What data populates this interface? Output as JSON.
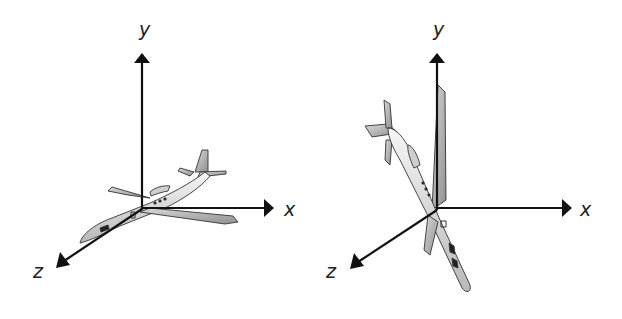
{
  "diagrams": [
    {
      "id": "level-flight",
      "axes": {
        "x_label": "x",
        "y_label": "y",
        "z_label": "z"
      },
      "object": "airplane",
      "orientation": "banked, nose toward +z, roughly level"
    },
    {
      "id": "nose-down",
      "axes": {
        "x_label": "x",
        "y_label": "y",
        "z_label": "z"
      },
      "object": "airplane",
      "orientation": "pitched nose-down, fuselage nearly vertical"
    }
  ],
  "colors": {
    "axis": "#111111",
    "plane_fill": "#e6e6e6",
    "plane_stroke": "#333333",
    "background": "#ffffff"
  }
}
